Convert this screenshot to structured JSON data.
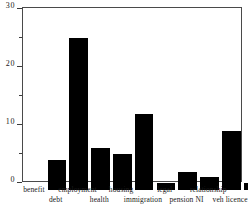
{
  "chart_data": {
    "type": "bar",
    "title": "",
    "subtitle": "",
    "xlabel": "",
    "ylabel": "",
    "categories": [
      "benefit",
      "debt",
      "employment",
      "health",
      "housing",
      "immigration",
      "legal",
      "pension NI",
      "relationship",
      "veh licence"
    ],
    "values": [
      5,
      26,
      7,
      6,
      13,
      1,
      3,
      2,
      10,
      1
    ],
    "ylim": [
      0,
      30
    ],
    "xlim": [
      0,
      10
    ],
    "y_ticks_major": [
      0,
      10,
      20,
      30
    ],
    "y_ticks_minor": [
      5,
      15,
      25
    ],
    "y_tick_labels": [
      "0",
      "10",
      "20",
      "30"
    ],
    "grid": false,
    "legend": null,
    "bar_color": "#000000",
    "frame_color": "#4a4a4a",
    "annotations": []
  },
  "axis": {
    "y": {
      "labels": [
        {
          "value": 0,
          "text": "0"
        },
        {
          "value": 10,
          "text": "10"
        },
        {
          "value": 20,
          "text": "20"
        },
        {
          "value": 30,
          "text": "30"
        }
      ]
    },
    "x": {
      "row_top": [
        "benefit",
        "employment",
        "housing",
        "legal",
        "relationship"
      ],
      "row_bottom": [
        "debt",
        "health",
        "immigration",
        "pension NI",
        "veh licence"
      ]
    }
  }
}
